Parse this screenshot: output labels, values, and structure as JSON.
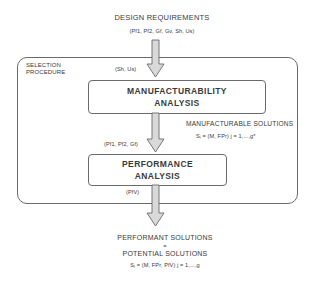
{
  "inputs": {
    "title": "DESIGN REQUIREMENTS",
    "params": "(Pf1, Pf2, Gf, Gv, Sh, Us)"
  },
  "procedure": {
    "label_line1": "SELECTION",
    "label_line2": "PROCEDURE",
    "manufacturability": {
      "input_params": "(Sh, Us)",
      "line1": "MANUFACTURABILITY",
      "line2": "ANALYSIS"
    },
    "manufacturable_output": {
      "title": "MANUFACTURABLE SOLUTIONS",
      "formula": "Sⱼ = (M, FPr)   j = 1,...,g*"
    },
    "performance": {
      "input_params": "(Pf1, Pf2, Gf)",
      "line1": "PERFORMANCE",
      "line2": "ANALYSIS",
      "output_params": "(PfV)"
    }
  },
  "outputs": {
    "line1": "PERFORMANT SOLUTIONS",
    "equals": "=",
    "line2": "POTENTIAL SOLUTIONS",
    "formula": "Sⱼ = (M, FPr, PfV)   j = 1,...,g"
  },
  "colors": {
    "stroke": "#6a6a6a",
    "arrow_fill": "#d9d9d9",
    "text": "#3a3a3a"
  }
}
